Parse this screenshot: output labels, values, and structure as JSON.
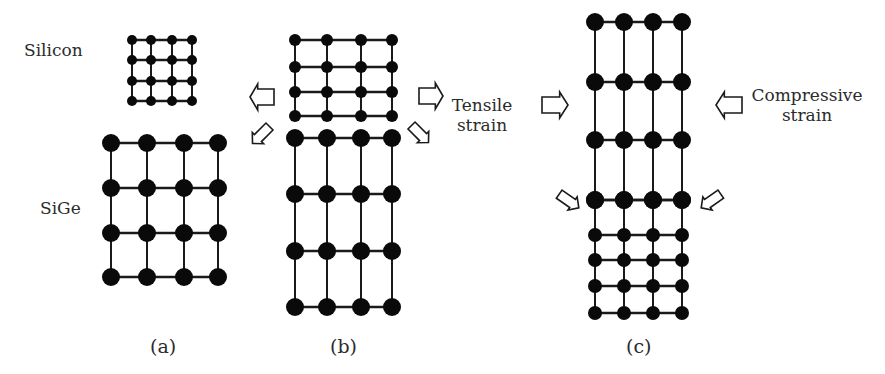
{
  "figure": {
    "colors": {
      "atom": "#0a0a0a",
      "bond": "#1a1a1a",
      "arrow_stroke": "#1a1a1a",
      "arrow_fill": "#ffffff",
      "text": "#2b2b2b"
    },
    "labels": {
      "silicon": "Silicon",
      "sige": "SiGe",
      "tensile_line1": "Tensile",
      "tensile_line2": "strain",
      "compressive_line1": "Compressive",
      "compressive_line2": "strain",
      "caption_a": "(a)",
      "caption_b": "(b)",
      "caption_c": "(c)"
    },
    "panels": [
      {
        "id": "a",
        "lattices": [
          {
            "name": "silicon-lattice",
            "xs": [
              132,
              151,
              172,
              192
            ],
            "ys": [
              40,
              60,
              81,
              101
            ],
            "r": [
              5,
              5,
              5,
              5
            ]
          },
          {
            "name": "sige-lattice",
            "xs": [
              111,
              147,
              184,
              218
            ],
            "ys": [
              143,
              188,
              233,
              277
            ],
            "r": [
              9,
              9,
              9,
              9
            ]
          }
        ]
      },
      {
        "id": "b",
        "lattices": [
          {
            "name": "strained-silicon-lattice",
            "xs": [
              295,
              327,
              361,
              392
            ],
            "ys": [
              40,
              67,
              92,
              116
            ],
            "r": [
              6,
              6,
              6,
              6
            ]
          },
          {
            "name": "sige-substrate-lattice",
            "xs": [
              295,
              327,
              361,
              392
            ],
            "ys": [
              138,
              194,
              251,
              307
            ],
            "r": [
              9,
              9,
              9,
              9
            ]
          }
        ]
      },
      {
        "id": "c",
        "lattices": [
          {
            "name": "strained-sige-lattice",
            "xs": [
              595,
              624,
              653,
              682
            ],
            "ys": [
              22,
              82,
              140,
              200
            ],
            "r": [
              9,
              9,
              9,
              9
            ]
          },
          {
            "name": "silicon-substrate-lattice",
            "xs": [
              595,
              624,
              653,
              682
            ],
            "ys": [
              200,
              235,
              260,
              286,
              313
            ],
            "r": [
              9,
              7,
              7,
              7,
              7
            ]
          }
        ]
      }
    ],
    "arrows": [
      {
        "name": "tensile-left-arrow",
        "x": 262,
        "y": 97,
        "angle": 180,
        "len": 24,
        "w": 26
      },
      {
        "name": "tensile-right-arrow",
        "x": 431,
        "y": 96,
        "angle": 0,
        "len": 24,
        "w": 26
      },
      {
        "name": "tensile-down-left-arrow",
        "x": 261,
        "y": 135,
        "angle": 135,
        "len": 24,
        "w": 16
      },
      {
        "name": "tensile-down-right-arrow",
        "x": 420,
        "y": 134,
        "angle": 45,
        "len": 24,
        "w": 16
      },
      {
        "name": "compressive-right-arrow",
        "x": 555,
        "y": 105,
        "angle": 0,
        "len": 26,
        "w": 26
      },
      {
        "name": "compressive-left-arrow",
        "x": 729,
        "y": 105,
        "angle": 180,
        "len": 26,
        "w": 26
      },
      {
        "name": "compressive-down-right-arrow",
        "x": 569,
        "y": 201,
        "angle": 35,
        "len": 24,
        "w": 16
      },
      {
        "name": "compressive-down-left-arrow",
        "x": 711,
        "y": 201,
        "angle": 145,
        "len": 24,
        "w": 16
      }
    ]
  }
}
